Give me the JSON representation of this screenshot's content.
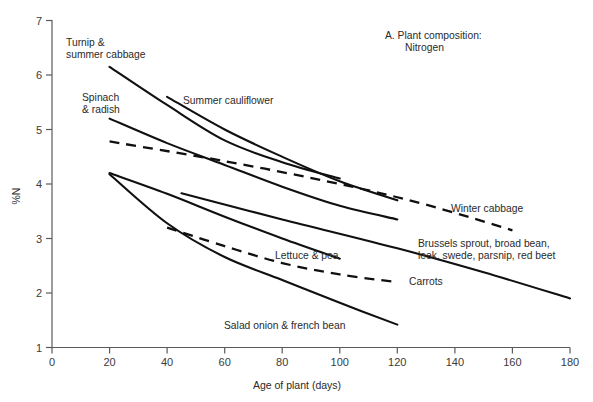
{
  "figure": {
    "panel_title_line1": "A. Plant composition:",
    "panel_title_line2": "Nitrogen",
    "y_axis_label": "%N",
    "x_axis_label": "Age of plant (days)"
  },
  "labels": {
    "turnip": "Turnip &\nsummer cabbage",
    "spinach": "Spinach\n& radish",
    "summer_cauliflower": "Summer cauliflower",
    "winter_cabbage": "Winter cabbage",
    "lettuce_pea": "Lettuce & pea",
    "brussels": "Brussels sprout, broad bean,\nleek, swede, parsnip, red beet",
    "carrots": "Carrots",
    "salad_onion": "Salad onion & french bean"
  },
  "chart_data": {
    "type": "line",
    "xlabel": "Age of plant (days)",
    "ylabel": "%N",
    "xlim": [
      0,
      180
    ],
    "ylim": [
      1,
      7
    ],
    "xticks": [
      0,
      20,
      40,
      60,
      80,
      100,
      120,
      140,
      160,
      180
    ],
    "yticks": [
      1,
      2,
      3,
      4,
      5,
      6,
      7
    ],
    "grid": false,
    "legend": "inline-labels",
    "series": [
      {
        "name": "Turnip & summer cabbage",
        "style": "solid",
        "x": [
          20,
          40,
          60,
          80,
          100
        ],
        "y": [
          6.15,
          5.45,
          4.8,
          4.4,
          4.1
        ]
      },
      {
        "name": "Spinach & radish",
        "style": "solid",
        "x": [
          20,
          40,
          60,
          80,
          100,
          120
        ],
        "y": [
          5.2,
          4.75,
          4.35,
          3.95,
          3.6,
          3.35
        ]
      },
      {
        "name": "Summer cauliflower",
        "style": "solid",
        "x": [
          40,
          60,
          80,
          100,
          120
        ],
        "y": [
          5.6,
          5.0,
          4.5,
          4.05,
          3.7
        ]
      },
      {
        "name": "Winter cabbage",
        "style": "dashed",
        "x": [
          20,
          60,
          100,
          130,
          160
        ],
        "y": [
          4.78,
          4.42,
          4.0,
          3.62,
          3.15
        ]
      },
      {
        "name": "Lettuce & pea",
        "style": "solid",
        "x": [
          20,
          40,
          60,
          80,
          100
        ],
        "y": [
          4.2,
          3.82,
          3.4,
          3.0,
          2.63
        ]
      },
      {
        "name": "Brussels sprout, broad bean, leek, swede, parsnip, red beet",
        "style": "solid",
        "x": [
          45,
          80,
          120,
          150,
          180
        ],
        "y": [
          3.83,
          3.35,
          2.82,
          2.38,
          1.9
        ]
      },
      {
        "name": "Carrots",
        "style": "dashed",
        "x": [
          40,
          60,
          80,
          100,
          120
        ],
        "y": [
          3.2,
          2.86,
          2.55,
          2.34,
          2.2
        ]
      },
      {
        "name": "Salad onion & french bean",
        "style": "solid",
        "x": [
          20,
          40,
          60,
          80,
          100,
          120
        ],
        "y": [
          4.18,
          3.28,
          2.66,
          2.24,
          1.82,
          1.42
        ]
      }
    ]
  }
}
